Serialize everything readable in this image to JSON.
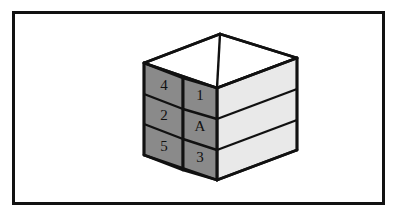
{
  "figure": {
    "frame": {
      "border_color": "#111111",
      "background_color": "#ffffff"
    },
    "cube": {
      "outline_color": "#111111",
      "front_face_color": "#8a8a8a",
      "side_face_color": "#e9e9e9",
      "top_face_color": "#ffffff",
      "left_face": {
        "name": "front-left-face",
        "cells": [
          {
            "label": "4",
            "row": 1
          },
          {
            "label": "2",
            "row": 2
          },
          {
            "label": "5",
            "row": 3
          }
        ]
      },
      "right_face": {
        "name": "front-right-face",
        "cells": [
          {
            "label": "1",
            "row": 1
          },
          {
            "label": "A",
            "row": 2
          },
          {
            "label": "3",
            "row": 3
          }
        ]
      },
      "side_face": {
        "name": "right-side-face",
        "slab_count": 3
      },
      "top_face": {
        "name": "top-face",
        "slab_count": 2
      }
    }
  }
}
